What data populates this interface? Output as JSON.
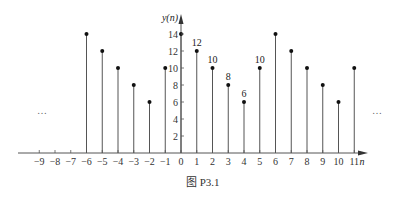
{
  "chart_data": {
    "type": "stem",
    "title": "",
    "caption": "图  P3.1",
    "xlabel": "n",
    "ylabel": "y(n)",
    "xlim": [
      -9,
      11
    ],
    "ylim": [
      0,
      14
    ],
    "x_ticks": [
      -9,
      -8,
      -7,
      -6,
      -5,
      -4,
      -3,
      -2,
      -1,
      0,
      1,
      2,
      3,
      4,
      5,
      6,
      7,
      8,
      9,
      10,
      11
    ],
    "x_tick_labels": [
      "−9",
      "−8",
      "−7",
      "−6",
      "−5",
      "−4",
      "−3",
      "−2",
      "−1",
      "0",
      "1",
      "2",
      "3",
      "4",
      "5",
      "6",
      "7",
      "8",
      "9",
      "10",
      "11"
    ],
    "y_ticks": [
      2,
      4,
      6,
      8,
      10,
      12,
      14
    ],
    "y_tick_labels": [
      "2",
      "4",
      "6",
      "8",
      "10",
      "12",
      "14"
    ],
    "x": [
      -6,
      -5,
      -4,
      -3,
      -2,
      -1,
      0,
      1,
      2,
      3,
      4,
      5,
      6,
      7,
      8,
      9,
      10,
      11
    ],
    "values": [
      14,
      12,
      10,
      8,
      6,
      10,
      14,
      12,
      10,
      8,
      6,
      10,
      14,
      12,
      10,
      8,
      6,
      10
    ],
    "data_labels": [
      {
        "x": 1,
        "y": 12,
        "text": "12"
      },
      {
        "x": 2,
        "y": 10,
        "text": "10"
      },
      {
        "x": 3,
        "y": 8,
        "text": "8"
      },
      {
        "x": 4,
        "y": 6,
        "text": "6"
      },
      {
        "x": 5,
        "y": 10,
        "text": "10"
      }
    ],
    "annotations": [
      {
        "text": "…",
        "position": "left"
      },
      {
        "text": "…",
        "position": "right"
      }
    ],
    "grid": false,
    "legend": null
  }
}
